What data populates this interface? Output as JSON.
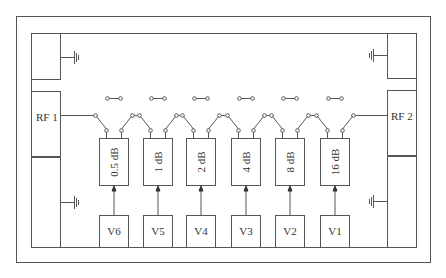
{
  "diagram": {
    "type": "digital step attenuator block diagram",
    "ports": {
      "left": "RF 1",
      "right": "RF 2"
    },
    "stages": [
      {
        "attenuation": "0.5 dB",
        "control": "V6"
      },
      {
        "attenuation": "1 dB",
        "control": "V5"
      },
      {
        "attenuation": "2 dB",
        "control": "V4"
      },
      {
        "attenuation": "4 dB",
        "control": "V3"
      },
      {
        "attenuation": "8 dB",
        "control": "V2"
      },
      {
        "attenuation": "16 dB",
        "control": "V1"
      }
    ],
    "ground_symbols": 4,
    "colors": {
      "line": "#555555",
      "text": "#333333",
      "background": "#ffffff"
    }
  }
}
